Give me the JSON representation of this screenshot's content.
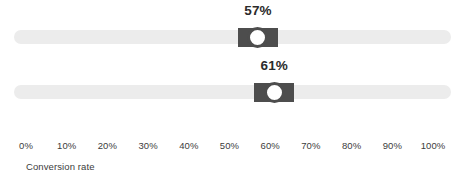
{
  "chart_data": {
    "type": "bar",
    "title": "",
    "xlabel": "Conversion rate",
    "ylabel": "",
    "xlim": [
      0,
      100
    ],
    "grid": false,
    "legend": null,
    "categories": [
      "slider-1",
      "slider-2"
    ],
    "values": [
      57,
      61
    ],
    "tick_labels": [
      "0%",
      "10%",
      "20%",
      "30%",
      "40%",
      "50%",
      "60%",
      "70%",
      "80%",
      "90%",
      "100%"
    ],
    "tick_values": [
      0,
      10,
      20,
      30,
      40,
      50,
      60,
      70,
      80,
      90,
      100
    ],
    "data_labels": [
      "57%",
      "61%"
    ]
  },
  "sliders": [
    {
      "name": "slider-1",
      "value": 57,
      "value_label": "57%"
    },
    {
      "name": "slider-2",
      "value": 61,
      "value_label": "61%"
    }
  ],
  "axis": {
    "title": "Conversion rate",
    "min": 0,
    "max": 100,
    "ticks": [
      {
        "value": 0,
        "label": "0%"
      },
      {
        "value": 10,
        "label": "10%"
      },
      {
        "value": 20,
        "label": "20%"
      },
      {
        "value": 30,
        "label": "30%"
      },
      {
        "value": 40,
        "label": "40%"
      },
      {
        "value": 50,
        "label": "50%"
      },
      {
        "value": 60,
        "label": "60%"
      },
      {
        "value": 70,
        "label": "70%"
      },
      {
        "value": 80,
        "label": "80%"
      },
      {
        "value": 90,
        "label": "90%"
      },
      {
        "value": 100,
        "label": "100%"
      }
    ]
  },
  "colors": {
    "track": "#ececec",
    "thumb": "#4d4d4d",
    "knob": "#ffffff",
    "value_text": "#2b2b2b",
    "axis_text": "#3c3c3c",
    "background": "#ffffff"
  }
}
